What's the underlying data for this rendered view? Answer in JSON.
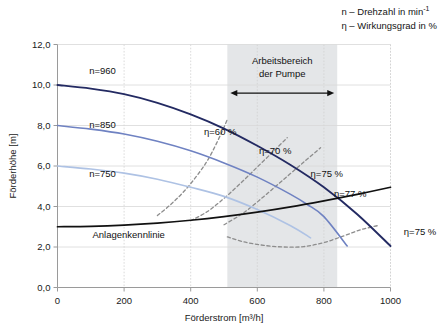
{
  "legend": {
    "lines": [
      {
        "symbol": "n",
        "dash": "–",
        "text": "Drehzahl in min",
        "sup": "-1"
      },
      {
        "symbol": "η",
        "dash": "–",
        "text": "Wirkungsgrad in %",
        "sup": ""
      }
    ],
    "line1_full": "n – Drehzahl in min",
    "line1_sup": "-1",
    "line2_full": "η – Wirkungsgrad in %"
  },
  "chart_data": {
    "type": "line",
    "title": "",
    "xlabel": "Förderstrom [m³/h]",
    "ylabel": "Förderhöhe [m]",
    "xlim": [
      0,
      1000
    ],
    "ylim": [
      0,
      12
    ],
    "xticks": [
      0,
      200,
      400,
      600,
      800,
      1000
    ],
    "xtick_labels": [
      "0",
      "200",
      "400",
      "600",
      "800",
      "1000"
    ],
    "yticks": [
      0,
      2,
      4,
      6,
      8,
      10,
      12
    ],
    "ytick_labels": [
      "0,0",
      "2,0",
      "4,0",
      "6,0",
      "8,0",
      "10,0",
      "12,0"
    ],
    "grid": "vertical dotted + horizontal solid light",
    "legend_position": "inline curve labels",
    "shaded_region": {
      "name": "Arbeitsbereich der Pumpe",
      "label_line1": "Arbeitsbereich",
      "label_line2": "der Pumpe",
      "x_start": 510,
      "x_end": 840,
      "color": "#e4e6e8"
    },
    "series": [
      {
        "name": "n=960",
        "label": "n=960",
        "kind": "pump-curve",
        "color": "#232a62",
        "width": 1.9,
        "style": "solid",
        "points": [
          [
            0,
            10.0
          ],
          [
            100,
            9.82
          ],
          [
            200,
            9.55
          ],
          [
            300,
            9.12
          ],
          [
            400,
            8.55
          ],
          [
            500,
            7.85
          ],
          [
            600,
            7.0
          ],
          [
            700,
            6.05
          ],
          [
            800,
            4.95
          ],
          [
            900,
            3.62
          ],
          [
            1000,
            2.05
          ]
        ]
      },
      {
        "name": "n=850",
        "label": "n=850",
        "kind": "pump-curve",
        "color": "#6f82c2",
        "width": 1.6,
        "style": "solid",
        "points": [
          [
            0,
            8.0
          ],
          [
            100,
            7.82
          ],
          [
            200,
            7.58
          ],
          [
            300,
            7.22
          ],
          [
            400,
            6.75
          ],
          [
            500,
            6.15
          ],
          [
            600,
            5.45
          ],
          [
            700,
            4.6
          ],
          [
            750,
            4.1
          ],
          [
            800,
            3.5
          ],
          [
            870,
            2.05
          ]
        ]
      },
      {
        "name": "n=750",
        "label": "n=750",
        "kind": "pump-curve",
        "color": "#aec2e4",
        "width": 1.6,
        "style": "solid",
        "points": [
          [
            0,
            6.0
          ],
          [
            100,
            5.85
          ],
          [
            200,
            5.65
          ],
          [
            300,
            5.35
          ],
          [
            400,
            4.95
          ],
          [
            500,
            4.5
          ],
          [
            600,
            3.85
          ],
          [
            700,
            3.05
          ],
          [
            760,
            2.45
          ]
        ]
      },
      {
        "name": "Anlagenkennlinie",
        "label": "Anlagenkennlinie",
        "kind": "system-curve",
        "color": "#111111",
        "width": 1.7,
        "style": "solid",
        "points": [
          [
            0,
            3.0
          ],
          [
            100,
            3.02
          ],
          [
            200,
            3.08
          ],
          [
            300,
            3.18
          ],
          [
            400,
            3.32
          ],
          [
            500,
            3.5
          ],
          [
            600,
            3.72
          ],
          [
            700,
            3.98
          ],
          [
            800,
            4.28
          ],
          [
            900,
            4.6
          ],
          [
            1000,
            4.95
          ]
        ]
      },
      {
        "name": "eta-60",
        "label": "η=60 %",
        "kind": "efficiency-curve",
        "color": "#8d8d8d",
        "width": 1.3,
        "style": "dashed",
        "points": [
          [
            300,
            3.55
          ],
          [
            340,
            4.1
          ],
          [
            380,
            4.75
          ],
          [
            420,
            5.55
          ],
          [
            455,
            6.4
          ],
          [
            490,
            7.55
          ],
          [
            510,
            8.3
          ]
        ]
      },
      {
        "name": "eta-70",
        "label": "η=70 %",
        "kind": "efficiency-curve",
        "color": "#8d8d8d",
        "width": 1.3,
        "style": "dashed",
        "points": [
          [
            400,
            3.3
          ],
          [
            450,
            3.75
          ],
          [
            500,
            4.4
          ],
          [
            550,
            5.15
          ],
          [
            600,
            5.95
          ],
          [
            650,
            6.75
          ],
          [
            690,
            7.4
          ]
        ]
      },
      {
        "name": "eta-75",
        "label": "η=75 %",
        "kind": "efficiency-curve",
        "color": "#8d8d8d",
        "width": 1.3,
        "style": "dashed",
        "points": [
          [
            500,
            3.1
          ],
          [
            560,
            3.7
          ],
          [
            620,
            4.5
          ],
          [
            680,
            5.35
          ],
          [
            740,
            6.2
          ],
          [
            790,
            6.9
          ]
        ]
      },
      {
        "name": "eta-75-lower",
        "label": "η=75 %",
        "kind": "efficiency-curve-lower",
        "color": "#8d8d8d",
        "width": 1.3,
        "style": "dashed",
        "points": [
          [
            510,
            2.5
          ],
          [
            560,
            2.25
          ],
          [
            620,
            2.08
          ],
          [
            680,
            2.0
          ],
          [
            740,
            2.02
          ],
          [
            800,
            2.22
          ],
          [
            860,
            2.55
          ],
          [
            910,
            2.85
          ],
          [
            960,
            3.05
          ]
        ]
      }
    ],
    "curve_labels": [
      {
        "text": "n=960",
        "x": 95,
        "y": 10.55
      },
      {
        "text": "n=850",
        "x": 95,
        "y": 7.9
      },
      {
        "text": "n=750",
        "x": 95,
        "y": 5.45
      },
      {
        "text": "Anlagenkennlinie",
        "x": 105,
        "y": 2.45
      },
      {
        "text": "η=60 %",
        "x": 440,
        "y": 7.55
      },
      {
        "text": "η=70 %",
        "x": 605,
        "y": 6.6
      },
      {
        "text": "η=75 %",
        "x": 760,
        "y": 5.45
      },
      {
        "text": "η=77 %",
        "x": 830,
        "y": 4.45
      },
      {
        "text": "η=75 %",
        "x": 1040,
        "y": 2.6
      }
    ]
  }
}
